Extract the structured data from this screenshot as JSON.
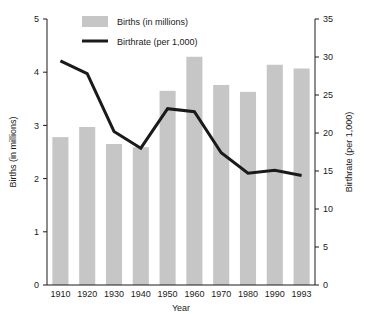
{
  "chart_data": {
    "type": "bar",
    "title": "",
    "subtitle": "",
    "xlabel": "Year",
    "categories": [
      "1910",
      "1920",
      "1930",
      "1940",
      "1950",
      "1960",
      "1970",
      "1980",
      "1990",
      "1993"
    ],
    "grid": false,
    "legend_position": "top-center",
    "legend": [
      {
        "name": "Births (in millions)",
        "marker": "filled-rect",
        "color": "#c6c6c6"
      },
      {
        "name": "Birthrate (per 1,000)",
        "marker": "line",
        "color": "#1a1a1a"
      }
    ],
    "axes": {
      "left": {
        "label": "Births (in millions)",
        "ylim": [
          0,
          5
        ],
        "ticks": [
          0,
          1,
          2,
          3,
          4,
          5
        ],
        "tick_labels": [
          "0",
          "1",
          "2",
          "3",
          "4",
          "5"
        ]
      },
      "right": {
        "label": "Birthrate (per 1,000)",
        "ylim": [
          0,
          35
        ],
        "ticks": [
          0,
          5,
          10,
          15,
          20,
          25,
          30,
          35
        ],
        "tick_labels": [
          "0",
          "5",
          "10",
          "15",
          "20",
          "25",
          "30",
          "35"
        ]
      }
    },
    "series": [
      {
        "name": "Births (in millions)",
        "type": "bar",
        "axis": "left",
        "color": "#c6c6c6",
        "values": [
          2.78,
          2.97,
          2.65,
          2.59,
          3.65,
          4.29,
          3.76,
          3.63,
          4.14,
          4.07
        ]
      },
      {
        "name": "Birthrate (per 1,000)",
        "type": "line",
        "axis": "right",
        "color": "#1a1a1a",
        "values": [
          29.5,
          27.8,
          20.2,
          18.0,
          23.2,
          22.8,
          17.4,
          14.7,
          15.1,
          14.4
        ]
      }
    ]
  }
}
